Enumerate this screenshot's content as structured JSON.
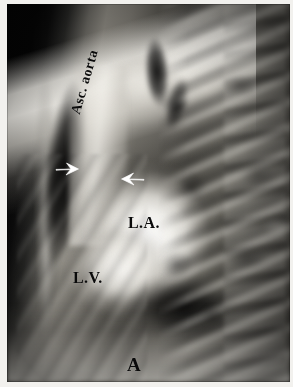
{
  "figure": {
    "kind": "lateral-chest-radiograph",
    "panel_label": "A",
    "background_color": "#000000",
    "paper_color": "#f2f1ee",
    "annotation_color": "#0a0a0a",
    "marker_color": "#ffffff"
  },
  "annotations": {
    "ascending_aorta": {
      "label": "Asc. aorta",
      "rotation_degrees": -74
    },
    "left_atrium": {
      "label": "L.A."
    },
    "left_ventricle": {
      "label": "L.V."
    },
    "panel": {
      "label": "A"
    }
  },
  "markers": [
    {
      "name": "anterior-aortic-border-arrow",
      "direction": "right",
      "color": "#ffffff"
    },
    {
      "name": "posterior-aortic-border-arrow",
      "direction": "left",
      "color": "#ffffff"
    }
  ]
}
